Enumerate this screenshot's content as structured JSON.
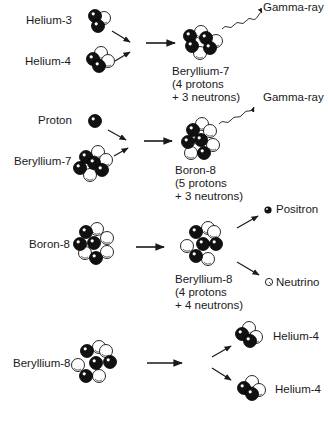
{
  "diagram": {
    "type": "nuclear-reaction-chain",
    "colors": {
      "proton": "#111111",
      "neutron": "#ffffff",
      "ink": "#1a1a1a",
      "background": "#ffffff"
    },
    "stages": [
      {
        "reactants": [
          {
            "label": "Helium-3",
            "protons": 2,
            "neutrons": 1
          },
          {
            "label": "Helium-4",
            "protons": 2,
            "neutrons": 2
          }
        ],
        "product": {
          "label": "Beryllium-7",
          "composition_line1": "(4 protons",
          "composition_line2": "+ 3 neutrons)"
        },
        "emissions": [
          {
            "label": "Gamma-ray",
            "style": "wavy"
          }
        ]
      },
      {
        "reactants": [
          {
            "label": "Proton",
            "protons": 1,
            "neutrons": 0
          },
          {
            "label": "Beryllium-7",
            "protons": 4,
            "neutrons": 3
          }
        ],
        "product": {
          "label": "Boron-8",
          "composition_line1": "(5 protons",
          "composition_line2": "+ 3 neutrons)"
        },
        "emissions": [
          {
            "label": "Gamma-ray",
            "style": "wavy"
          }
        ]
      },
      {
        "reactants": [
          {
            "label": "Boron-8",
            "protons": 5,
            "neutrons": 3
          }
        ],
        "product": {
          "label": "Beryllium-8",
          "composition_line1": "(4 protons",
          "composition_line2": "+ 4 neutrons)"
        },
        "emissions": [
          {
            "label": "Positron",
            "style": "arrow"
          },
          {
            "label": "Neutrino",
            "style": "arrow"
          }
        ]
      },
      {
        "reactants": [
          {
            "label": "Beryllium-8",
            "protons": 4,
            "neutrons": 4
          }
        ],
        "products": [
          {
            "label": "Helium-4"
          },
          {
            "label": "Helium-4"
          }
        ]
      }
    ]
  }
}
